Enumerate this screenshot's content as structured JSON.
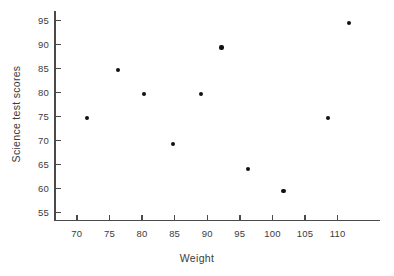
{
  "chart_data": {
    "type": "scatter",
    "title": "",
    "xlabel": "Weight",
    "ylabel": "Science test scores",
    "xlim": [
      66.5,
      116.5
    ],
    "ylim": [
      53.5,
      97
    ],
    "grid": false,
    "legend": null,
    "xticks": [
      70,
      75,
      80,
      85,
      90,
      95,
      100,
      105,
      110
    ],
    "yticks": [
      55,
      60,
      65,
      70,
      75,
      80,
      85,
      90,
      95
    ],
    "xtick_labels": [
      "70",
      "75",
      "80",
      "85",
      "90",
      "95",
      "100",
      "105",
      "110"
    ],
    "ytick_labels": [
      "55",
      "60",
      "65",
      "70",
      "75",
      "80",
      "85",
      "90",
      "95"
    ],
    "series": [
      {
        "name": "students",
        "marker": "filled-circle",
        "color": "#111111",
        "points": [
          {
            "x": 71.5,
            "y": 74.8
          },
          {
            "x": 76.3,
            "y": 84.7
          },
          {
            "x": 80.3,
            "y": 79.7
          },
          {
            "x": 84.8,
            "y": 69.4
          },
          {
            "x": 89.1,
            "y": 79.7
          },
          {
            "x": 92.2,
            "y": 89.4
          },
          {
            "x": 96.2,
            "y": 64.1
          },
          {
            "x": 101.7,
            "y": 59.6
          },
          {
            "x": 108.5,
            "y": 74.8
          },
          {
            "x": 111.8,
            "y": 94.5
          }
        ]
      }
    ]
  },
  "style": {
    "axis_color": "#4a4a4a",
    "text_color": "#3b3b3b",
    "point_color": "#111111",
    "background": "#ffffff"
  }
}
